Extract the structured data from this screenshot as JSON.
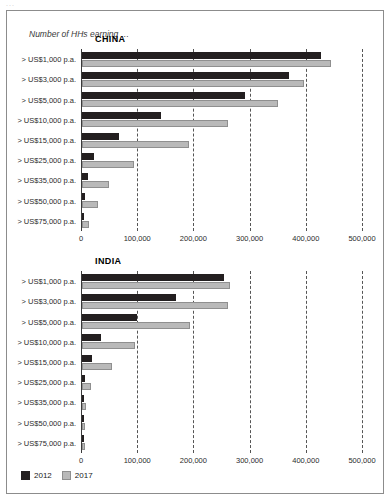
{
  "page_crumb": "...",
  "caption": "Number of HHs earning …",
  "legend": {
    "items": [
      {
        "label": "2012",
        "color": "#231f20"
      },
      {
        "label": "2017",
        "color": "#b9b9b9"
      }
    ]
  },
  "chart_data": [
    {
      "type": "bar",
      "title": "CHINA",
      "orientation": "horizontal",
      "xlabel": "",
      "ylabel": "",
      "grid": true,
      "legend_position": "bottom-left",
      "xlim": [
        0,
        500000
      ],
      "xticks": [
        0,
        100000,
        200000,
        300000,
        400000,
        500000
      ],
      "xticklabels": [
        "0",
        "100,000",
        "200,000",
        "300,000",
        "400,000",
        "500,000"
      ],
      "categories": [
        "> US$1,000 p.a.",
        "> US$3,000 p.a.",
        "> US$5,000 p.a.",
        "> US$10,000 p.a.",
        "> US$15,000 p.a.",
        "> US$25,000 p.a.",
        "> US$35,000 p.a.",
        "> US$50,000 p.a.",
        "> US$75,000 p.a."
      ],
      "series": [
        {
          "name": "2012",
          "values": [
            425000,
            368000,
            290000,
            140000,
            65000,
            22000,
            11000,
            5000,
            2000
          ]
        },
        {
          "name": "2017",
          "values": [
            443000,
            395000,
            348000,
            260000,
            190000,
            93000,
            48000,
            29000,
            12000
          ]
        }
      ]
    },
    {
      "type": "bar",
      "title": "INDIA",
      "orientation": "horizontal",
      "xlabel": "",
      "ylabel": "",
      "grid": true,
      "legend_position": "bottom-left",
      "xlim": [
        0,
        500000
      ],
      "xticks": [
        0,
        100000,
        200000,
        300000,
        400000,
        500000
      ],
      "xticklabels": [
        "0",
        "100,000",
        "200,000",
        "300,000",
        "400,000",
        "500,000"
      ],
      "categories": [
        "> US$1,000 p.a.",
        "> US$3,000 p.a.",
        "> US$5,000 p.a.",
        "> US$10,000 p.a.",
        "> US$15,000 p.a.",
        "> US$25,000 p.a.",
        "> US$35,000 p.a.",
        "> US$50,000 p.a.",
        "> US$75,000 p.a."
      ],
      "series": [
        {
          "name": "2012",
          "values": [
            252000,
            168000,
            98000,
            33000,
            18000,
            5000,
            2000,
            1000,
            500
          ]
        },
        {
          "name": "2017",
          "values": [
            264000,
            260000,
            192000,
            95000,
            53000,
            16000,
            7000,
            3000,
            1500
          ]
        }
      ]
    }
  ]
}
